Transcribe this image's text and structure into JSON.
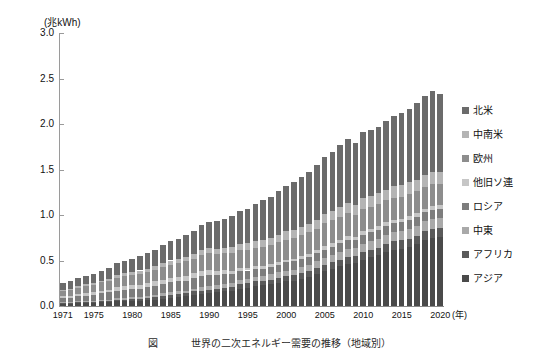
{
  "axis": {
    "unit_label": "(兆kWh)",
    "x_unit_label": "(年)",
    "y_ticks": [
      "3.0",
      "2.5",
      "2.0",
      "1.5",
      "1.0",
      "0.5",
      "0.0"
    ],
    "x_ticks": [
      "1971",
      "1975",
      "1980",
      "1985",
      "1990",
      "1995",
      "2000",
      "2005",
      "2010",
      "2015",
      "2020"
    ]
  },
  "legend": {
    "items": [
      {
        "label": "北米",
        "color": "#6b6b6b"
      },
      {
        "label": "中南米",
        "color": "#b4b4b4"
      },
      {
        "label": "欧州",
        "color": "#8d8d8d"
      },
      {
        "label": "他旧ソ連",
        "color": "#c6c6c6"
      },
      {
        "label": "ロシア",
        "color": "#7d7d7d"
      },
      {
        "label": "中東",
        "color": "#a9a9a9"
      },
      {
        "label": "アフリカ",
        "color": "#5a5a5a"
      },
      {
        "label": "アジア",
        "color": "#4a4a4a"
      }
    ]
  },
  "caption": {
    "text": "図 　　　世界の二次エネルギー需要の推移（地域別）"
  },
  "chart_data": {
    "type": "bar",
    "title": "",
    "subtitle": "",
    "xlabel": "(年)",
    "ylabel": "(兆kWh)",
    "ylim": [
      0.0,
      3.0
    ],
    "ytick_step": 0.5,
    "grid": false,
    "stacked": true,
    "legend_position": "right",
    "categories": [
      "1971",
      "1972",
      "1973",
      "1974",
      "1975",
      "1976",
      "1977",
      "1978",
      "1979",
      "1980",
      "1981",
      "1982",
      "1983",
      "1984",
      "1985",
      "1986",
      "1987",
      "1988",
      "1989",
      "1990",
      "1991",
      "1992",
      "1993",
      "1994",
      "1995",
      "1996",
      "1997",
      "1998",
      "1999",
      "2000",
      "2001",
      "2002",
      "2003",
      "2004",
      "2005",
      "2006",
      "2007",
      "2008",
      "2009",
      "2010",
      "2011",
      "2012",
      "2013",
      "2014",
      "2015",
      "2016",
      "2017",
      "2018",
      "2019",
      "2020"
    ],
    "series": [
      {
        "name": "アジア",
        "values": [
          0.02,
          0.02,
          0.03,
          0.03,
          0.03,
          0.04,
          0.04,
          0.05,
          0.05,
          0.06,
          0.06,
          0.07,
          0.07,
          0.08,
          0.09,
          0.1,
          0.11,
          0.12,
          0.13,
          0.14,
          0.15,
          0.16,
          0.17,
          0.19,
          0.2,
          0.22,
          0.23,
          0.24,
          0.25,
          0.27,
          0.28,
          0.3,
          0.32,
          0.35,
          0.38,
          0.41,
          0.44,
          0.46,
          0.47,
          0.51,
          0.54,
          0.56,
          0.59,
          0.62,
          0.63,
          0.65,
          0.68,
          0.72,
          0.75,
          0.76
        ]
      },
      {
        "name": "アフリカ",
        "values": [
          0.01,
          0.01,
          0.01,
          0.01,
          0.01,
          0.02,
          0.02,
          0.02,
          0.02,
          0.02,
          0.02,
          0.02,
          0.03,
          0.03,
          0.03,
          0.03,
          0.03,
          0.04,
          0.04,
          0.04,
          0.04,
          0.04,
          0.04,
          0.05,
          0.05,
          0.05,
          0.05,
          0.05,
          0.06,
          0.06,
          0.06,
          0.06,
          0.06,
          0.07,
          0.07,
          0.07,
          0.07,
          0.08,
          0.08,
          0.08,
          0.08,
          0.08,
          0.09,
          0.09,
          0.09,
          0.09,
          0.09,
          0.1,
          0.1,
          0.1
        ]
      },
      {
        "name": "中東",
        "values": [
          0.01,
          0.01,
          0.01,
          0.01,
          0.01,
          0.01,
          0.01,
          0.02,
          0.02,
          0.02,
          0.02,
          0.02,
          0.02,
          0.03,
          0.03,
          0.03,
          0.03,
          0.03,
          0.04,
          0.04,
          0.04,
          0.04,
          0.04,
          0.05,
          0.05,
          0.05,
          0.05,
          0.06,
          0.06,
          0.06,
          0.06,
          0.07,
          0.07,
          0.07,
          0.08,
          0.08,
          0.08,
          0.09,
          0.09,
          0.09,
          0.09,
          0.1,
          0.1,
          0.1,
          0.1,
          0.11,
          0.11,
          0.11,
          0.11,
          0.11
        ]
      },
      {
        "name": "ロシア",
        "values": [
          0.05,
          0.05,
          0.06,
          0.06,
          0.07,
          0.07,
          0.08,
          0.08,
          0.09,
          0.09,
          0.09,
          0.1,
          0.1,
          0.1,
          0.11,
          0.11,
          0.11,
          0.12,
          0.12,
          0.12,
          0.11,
          0.11,
          0.1,
          0.09,
          0.09,
          0.09,
          0.08,
          0.08,
          0.08,
          0.09,
          0.09,
          0.09,
          0.09,
          0.09,
          0.09,
          0.09,
          0.1,
          0.1,
          0.09,
          0.1,
          0.1,
          0.1,
          0.1,
          0.1,
          0.1,
          0.1,
          0.1,
          0.1,
          0.1,
          0.1
        ]
      },
      {
        "name": "他旧ソ連",
        "values": [
          0.02,
          0.02,
          0.02,
          0.03,
          0.03,
          0.03,
          0.03,
          0.04,
          0.04,
          0.04,
          0.04,
          0.04,
          0.05,
          0.05,
          0.05,
          0.05,
          0.05,
          0.05,
          0.06,
          0.06,
          0.05,
          0.05,
          0.04,
          0.04,
          0.03,
          0.03,
          0.03,
          0.03,
          0.03,
          0.03,
          0.03,
          0.03,
          0.03,
          0.03,
          0.04,
          0.04,
          0.04,
          0.04,
          0.03,
          0.04,
          0.04,
          0.04,
          0.04,
          0.04,
          0.04,
          0.04,
          0.04,
          0.04,
          0.04,
          0.04
        ]
      },
      {
        "name": "欧州",
        "values": [
          0.06,
          0.07,
          0.07,
          0.08,
          0.08,
          0.09,
          0.09,
          0.1,
          0.11,
          0.11,
          0.12,
          0.12,
          0.13,
          0.14,
          0.14,
          0.15,
          0.16,
          0.16,
          0.17,
          0.18,
          0.18,
          0.18,
          0.19,
          0.19,
          0.2,
          0.2,
          0.21,
          0.21,
          0.22,
          0.22,
          0.23,
          0.23,
          0.24,
          0.24,
          0.25,
          0.25,
          0.25,
          0.25,
          0.24,
          0.25,
          0.24,
          0.24,
          0.24,
          0.24,
          0.24,
          0.24,
          0.24,
          0.24,
          0.24,
          0.23
        ]
      },
      {
        "name": "中南米",
        "values": [
          0.01,
          0.01,
          0.02,
          0.02,
          0.02,
          0.02,
          0.03,
          0.03,
          0.03,
          0.03,
          0.04,
          0.04,
          0.04,
          0.04,
          0.05,
          0.05,
          0.05,
          0.05,
          0.06,
          0.06,
          0.06,
          0.06,
          0.07,
          0.07,
          0.07,
          0.07,
          0.08,
          0.08,
          0.08,
          0.09,
          0.09,
          0.09,
          0.09,
          0.1,
          0.1,
          0.1,
          0.11,
          0.11,
          0.11,
          0.12,
          0.12,
          0.12,
          0.12,
          0.13,
          0.13,
          0.13,
          0.13,
          0.13,
          0.13,
          0.13
        ]
      },
      {
        "name": "北米",
        "values": [
          0.07,
          0.08,
          0.09,
          0.09,
          0.1,
          0.11,
          0.12,
          0.13,
          0.14,
          0.15,
          0.16,
          0.17,
          0.18,
          0.2,
          0.21,
          0.22,
          0.24,
          0.25,
          0.27,
          0.28,
          0.3,
          0.32,
          0.34,
          0.36,
          0.38,
          0.41,
          0.43,
          0.45,
          0.48,
          0.5,
          0.52,
          0.55,
          0.57,
          0.6,
          0.63,
          0.65,
          0.68,
          0.7,
          0.68,
          0.72,
          0.72,
          0.73,
          0.75,
          0.77,
          0.79,
          0.81,
          0.84,
          0.87,
          0.89,
          0.86
        ]
      }
    ]
  }
}
